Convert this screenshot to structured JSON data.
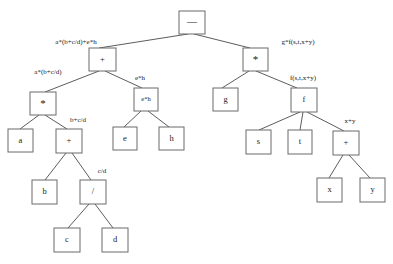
{
  "diagram": {
    "type": "expression-tree",
    "canvas": {
      "width": 393,
      "height": 264,
      "background": "#ffffff"
    },
    "style": {
      "node_fill": "#ffffff",
      "node_stroke": "#6b6b6b",
      "edge_stroke": "#4a4a4a",
      "text_color": "#1a1a1a"
    },
    "root_expression": "a*(b+c/d)+e*h - g*f(s,t,x+y)",
    "nodes": [
      {
        "id": "n_minus",
        "label": "—",
        "x": 179,
        "y": 11,
        "w": 26,
        "h": 23,
        "style": "op-minus"
      },
      {
        "id": "n_plus1",
        "label": "+",
        "x": 89,
        "y": 48,
        "w": 27,
        "h": 23,
        "style": ""
      },
      {
        "id": "n_star1",
        "label": "*",
        "x": 243,
        "y": 48,
        "w": 25,
        "h": 23,
        "style": "op-star"
      },
      {
        "id": "n_star2",
        "label": "*",
        "x": 30,
        "y": 92,
        "w": 26,
        "h": 23,
        "style": "op-star"
      },
      {
        "id": "n_eh",
        "label": "e*h",
        "x": 134,
        "y": 88,
        "w": 24,
        "h": 23,
        "style": "small-expr"
      },
      {
        "id": "n_g",
        "label": "g",
        "x": 213,
        "y": 88,
        "w": 25,
        "h": 23,
        "style": ""
      },
      {
        "id": "n_f",
        "label": "f",
        "x": 291,
        "y": 88,
        "w": 26,
        "h": 24,
        "style": ""
      },
      {
        "id": "n_a",
        "label": "a",
        "x": 8,
        "y": 129,
        "w": 25,
        "h": 23,
        "style": ""
      },
      {
        "id": "n_plus2",
        "label": "+",
        "x": 56,
        "y": 129,
        "w": 26,
        "h": 24,
        "style": ""
      },
      {
        "id": "n_e",
        "label": "e",
        "x": 113,
        "y": 127,
        "w": 24,
        "h": 23,
        "style": ""
      },
      {
        "id": "n_h",
        "label": "h",
        "x": 159,
        "y": 127,
        "w": 25,
        "h": 23,
        "style": ""
      },
      {
        "id": "n_s",
        "label": "s",
        "x": 246,
        "y": 130,
        "w": 25,
        "h": 24,
        "style": ""
      },
      {
        "id": "n_t",
        "label": "t",
        "x": 288,
        "y": 130,
        "w": 24,
        "h": 24,
        "style": ""
      },
      {
        "id": "n_plus3",
        "label": "+",
        "x": 333,
        "y": 131,
        "w": 26,
        "h": 24,
        "style": ""
      },
      {
        "id": "n_b",
        "label": "b",
        "x": 32,
        "y": 180,
        "w": 25,
        "h": 24,
        "style": ""
      },
      {
        "id": "n_div",
        "label": "/",
        "x": 80,
        "y": 180,
        "w": 26,
        "h": 24,
        "style": ""
      },
      {
        "id": "n_x",
        "label": "x",
        "x": 317,
        "y": 178,
        "w": 25,
        "h": 24,
        "style": ""
      },
      {
        "id": "n_y",
        "label": "y",
        "x": 360,
        "y": 178,
        "w": 25,
        "h": 24,
        "style": ""
      },
      {
        "id": "n_c",
        "label": "c",
        "x": 54,
        "y": 228,
        "w": 26,
        "h": 24,
        "style": ""
      },
      {
        "id": "n_d",
        "label": "d",
        "x": 102,
        "y": 228,
        "w": 26,
        "h": 24,
        "style": ""
      }
    ],
    "edges": [
      {
        "id": "e1",
        "from": "n_minus",
        "to": "n_plus1",
        "x1": 188,
        "y1": 34,
        "x2": 99,
        "y2": 48
      },
      {
        "id": "e2",
        "from": "n_minus",
        "to": "n_star1",
        "x1": 194,
        "y1": 34,
        "x2": 250,
        "y2": 48
      },
      {
        "id": "e3",
        "from": "n_plus1",
        "to": "n_star2",
        "x1": 99,
        "y1": 71,
        "x2": 45,
        "y2": 92
      },
      {
        "id": "e4",
        "from": "n_plus1",
        "to": "n_eh",
        "x1": 105,
        "y1": 71,
        "x2": 142,
        "y2": 88
      },
      {
        "id": "e5",
        "from": "n_star1",
        "to": "n_g",
        "x1": 249,
        "y1": 71,
        "x2": 222,
        "y2": 88
      },
      {
        "id": "e6",
        "from": "n_star1",
        "to": "n_f",
        "x1": 256,
        "y1": 71,
        "x2": 297,
        "y2": 88
      },
      {
        "id": "e7",
        "from": "n_star2",
        "to": "n_a",
        "x1": 39,
        "y1": 115,
        "x2": 20,
        "y2": 129
      },
      {
        "id": "e8",
        "from": "n_star2",
        "to": "n_plus2",
        "x1": 45,
        "y1": 115,
        "x2": 67,
        "y2": 129
      },
      {
        "id": "e9",
        "from": "n_eh",
        "to": "n_e",
        "x1": 141,
        "y1": 111,
        "x2": 124,
        "y2": 127
      },
      {
        "id": "e10",
        "from": "n_eh",
        "to": "n_h",
        "x1": 148,
        "y1": 111,
        "x2": 169,
        "y2": 127
      },
      {
        "id": "e11",
        "from": "n_f",
        "to": "n_s",
        "x1": 300,
        "y1": 112,
        "x2": 259,
        "y2": 130
      },
      {
        "id": "e12",
        "from": "n_f",
        "to": "n_t",
        "x1": 303,
        "y1": 112,
        "x2": 300,
        "y2": 130
      },
      {
        "id": "e13",
        "from": "n_f",
        "to": "n_plus3",
        "x1": 307,
        "y1": 112,
        "x2": 344,
        "y2": 131
      },
      {
        "id": "e14",
        "from": "n_plus2",
        "to": "n_b",
        "x1": 66,
        "y1": 153,
        "x2": 45,
        "y2": 180
      },
      {
        "id": "e15",
        "from": "n_plus2",
        "to": "n_div",
        "x1": 72,
        "y1": 153,
        "x2": 91,
        "y2": 180
      },
      {
        "id": "e16",
        "from": "n_plus3",
        "to": "n_x",
        "x1": 343,
        "y1": 155,
        "x2": 329,
        "y2": 178
      },
      {
        "id": "e17",
        "from": "n_plus3",
        "to": "n_y",
        "x1": 349,
        "y1": 155,
        "x2": 370,
        "y2": 178
      },
      {
        "id": "e18",
        "from": "n_div",
        "to": "n_c",
        "x1": 89,
        "y1": 204,
        "x2": 68,
        "y2": 228
      },
      {
        "id": "e19",
        "from": "n_div",
        "to": "n_d",
        "x1": 95,
        "y1": 204,
        "x2": 113,
        "y2": 228
      }
    ],
    "edge_labels": [
      {
        "id": "l1",
        "text": "a*(b+c/d)+e*h",
        "x": 76,
        "y": 42,
        "edge": "e1"
      },
      {
        "id": "l2",
        "text": "g*f(s,t,x+y)",
        "x": 298,
        "y": 42,
        "edge": "e2"
      },
      {
        "id": "l3",
        "text": "a*(b+c/d)",
        "x": 48,
        "y": 72,
        "edge": "e3"
      },
      {
        "id": "l4",
        "text": "e*h",
        "x": 140,
        "y": 78,
        "edge": "e4"
      },
      {
        "id": "l5",
        "text": "f(s,t,x+y)",
        "x": 303,
        "y": 78,
        "edge": "e6"
      },
      {
        "id": "l6",
        "text": "b+c/d",
        "x": 78,
        "y": 120,
        "edge": "e8"
      },
      {
        "id": "l7",
        "text": "x+y",
        "x": 350,
        "y": 121,
        "edge": "e13"
      },
      {
        "id": "l8",
        "text": "c/d",
        "x": 102,
        "y": 171,
        "edge": "e15"
      }
    ]
  }
}
